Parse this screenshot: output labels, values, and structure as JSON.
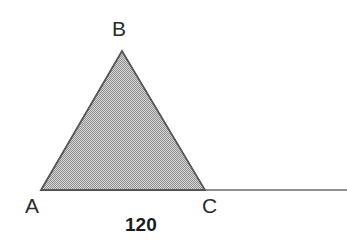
{
  "figure": {
    "background_color": "#ffffff",
    "width": 347,
    "height": 252,
    "stroke_color": "#555555",
    "fill_color": "#b0b0b0",
    "label_color": "#2b2b2b",
    "measure_color": "#1c1c1c"
  },
  "labels": {
    "vertex_a": "A",
    "vertex_b": "B",
    "vertex_c": "C",
    "base_length": "120"
  },
  "chart_data": {
    "type": "diagram",
    "shapes": [
      {
        "name": "baseline",
        "kind": "line",
        "points": [
          [
            41,
            190
          ],
          [
            347,
            190
          ]
        ],
        "stroke": "#6b6b6b",
        "stroke_width": 1.4
      },
      {
        "name": "triangle-abc",
        "kind": "polygon",
        "points": [
          [
            41,
            190
          ],
          [
            122,
            51
          ],
          [
            205,
            190
          ]
        ],
        "fill": "#b0b0b0",
        "stroke": "#555555",
        "stroke_width": 1.8,
        "fill_pattern": "checkerboard-gray"
      }
    ],
    "vertices": [
      {
        "name": "A",
        "x": 41,
        "y": 190,
        "label": "A",
        "label_position": "below-left"
      },
      {
        "name": "B",
        "x": 122,
        "y": 51,
        "label": "B",
        "label_position": "above"
      },
      {
        "name": "C",
        "x": 205,
        "y": 190,
        "label": "C",
        "label_position": "below-right"
      }
    ],
    "annotations": [
      {
        "name": "base-length",
        "text": "120",
        "x": 145,
        "y": 225,
        "bold": true,
        "refers_to": "segment AC"
      }
    ],
    "xlabel": "",
    "ylabel": "",
    "grid": false,
    "legend": false
  }
}
